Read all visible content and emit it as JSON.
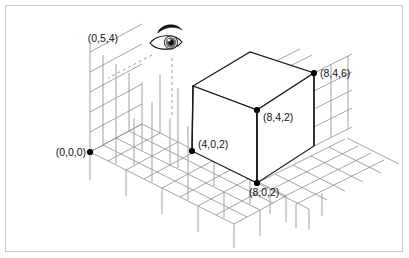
{
  "figure": {
    "type": "isometric-3d-coordinate-diagram",
    "title": "",
    "border_color": "#c9c9c9",
    "background_color": "#ffffff",
    "line_color": "#1a1a1a",
    "grid_color": "#8c8c8c",
    "grid_color_light": "#b0b0b0",
    "dash_color": "#9a9a9a"
  },
  "viewpoint": {
    "label": "(0,5,4)",
    "icon": "eye-icon",
    "description": "eye viewing the scene"
  },
  "points": [
    {
      "id": "origin",
      "label": "(0,0,0)",
      "x": 0,
      "y": 0,
      "z": 0,
      "px": 90,
      "py": 152,
      "label_anchor": "end",
      "label_px": 86,
      "label_py": 156
    },
    {
      "id": "front-left",
      "label": "(4,0,2)",
      "x": 4,
      "y": 0,
      "z": 2,
      "px": 192,
      "py": 151,
      "label_anchor": "start",
      "label_px": 198,
      "label_py": 148
    },
    {
      "id": "front-bottom",
      "label": "(8,0,2)",
      "x": 8,
      "y": 0,
      "z": 2,
      "px": 257,
      "py": 183,
      "label_anchor": "start",
      "label_px": 249,
      "label_py": 196
    },
    {
      "id": "front-top",
      "label": "(8,4,2)",
      "x": 8,
      "y": 4,
      "z": 2,
      "px": 257,
      "py": 110,
      "label_anchor": "start",
      "label_px": 263,
      "label_py": 121
    },
    {
      "id": "right-top",
      "label": "(8,4,6)",
      "x": 8,
      "y": 4,
      "z": 6,
      "px": 314,
      "py": 73,
      "label_anchor": "start",
      "label_px": 320,
      "label_py": 77
    }
  ],
  "cube": {
    "name": "solid-block",
    "vertices": {
      "top_left": [
        193,
        86
      ],
      "top_back": [
        250,
        52
      ],
      "top_right": [
        314,
        73
      ],
      "top_front": [
        257,
        110
      ],
      "bot_left": [
        192,
        151
      ],
      "bot_front": [
        257,
        183
      ],
      "bot_right": [
        314,
        146
      ]
    }
  },
  "grid": {
    "floor": {
      "name": "floor-grid",
      "u_steps": 8,
      "v_steps": 4
    },
    "wall": {
      "name": "back-wall-grid",
      "rows": 5,
      "cols": 4
    },
    "right": {
      "name": "right-wall-grid",
      "rows": 4
    }
  },
  "sight_lines": [
    {
      "id": "diagonal-sight-line",
      "style": "dashed"
    },
    {
      "id": "vertical-drop-line",
      "style": "dashed"
    }
  ]
}
